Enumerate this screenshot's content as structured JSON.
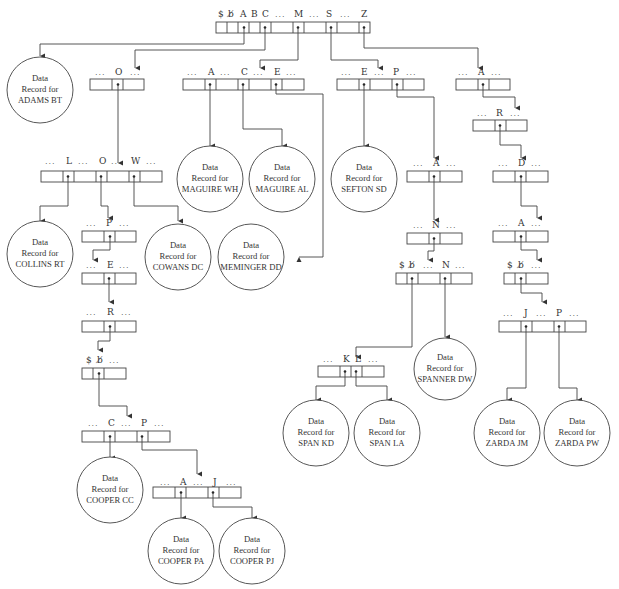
{
  "diagram": {
    "type": "trie-index-tree",
    "record_prefix_line1": "Data",
    "record_prefix_line2": "Record for",
    "ellipsis": "...",
    "blank_symbol": "b̸",
    "dollar_symbol": "$"
  },
  "nodes": {
    "root": {
      "labels": [
        "$",
        "b̸",
        "A",
        "B",
        "C",
        "...",
        "M",
        "...",
        "S",
        "...",
        "Z"
      ]
    },
    "n_A": {
      "labels": [
        "...",
        "O",
        "..."
      ]
    },
    "n_M": {
      "labels": [
        "...",
        "A",
        "...",
        "C",
        "...",
        "E",
        "..."
      ]
    },
    "n_S": {
      "labels": [
        "...",
        "E",
        "...",
        "P",
        "..."
      ]
    },
    "n_Z": {
      "labels": [
        "...",
        "A",
        "..."
      ]
    },
    "n_ZA": {
      "labels": [
        "...",
        "R",
        "..."
      ]
    },
    "n_ZAR": {
      "labels": [
        "...",
        "D",
        "..."
      ]
    },
    "n_ZARD": {
      "labels": [
        "...",
        "A",
        "..."
      ]
    },
    "n_ZARDA": {
      "labels": [
        "$",
        "b̸",
        "..."
      ]
    },
    "n_ZARDAb": {
      "labels": [
        "...",
        "J",
        "...",
        "P",
        "..."
      ]
    },
    "n_CO": {
      "labels": [
        "...",
        "L",
        "...",
        "O",
        "...",
        "W",
        "..."
      ]
    },
    "n_COO": {
      "labels": [
        "...",
        "P",
        "..."
      ]
    },
    "n_COOP": {
      "labels": [
        "...",
        "E",
        "..."
      ]
    },
    "n_COOPE": {
      "labels": [
        "...",
        "R",
        "..."
      ]
    },
    "n_COOPER": {
      "labels": [
        "$",
        "b̸",
        "..."
      ]
    },
    "n_COOPERb": {
      "labels": [
        "...",
        "C",
        "...",
        "P",
        "..."
      ]
    },
    "n_COOPERbP": {
      "labels": [
        "...",
        "A",
        "...",
        "J",
        "..."
      ]
    },
    "n_SP": {
      "labels": [
        "...",
        "A",
        "..."
      ]
    },
    "n_SPA": {
      "labels": [
        "...",
        "N",
        "..."
      ]
    },
    "n_SPAN": {
      "labels": [
        "$",
        "b̸",
        "...",
        "N",
        "..."
      ]
    },
    "n_SPANb": {
      "labels": [
        "...",
        "K",
        "L",
        "..."
      ]
    }
  },
  "records": [
    {
      "id": "adams",
      "name": "ADAMS BT"
    },
    {
      "id": "maguire_wh",
      "name": "MAGUIRE WH"
    },
    {
      "id": "maguire_al",
      "name": "MAGUIRE AL"
    },
    {
      "id": "sefton",
      "name": "SEFTON SD"
    },
    {
      "id": "collins",
      "name": "COLLINS RT"
    },
    {
      "id": "cowans",
      "name": "COWANS DC"
    },
    {
      "id": "meminger",
      "name": "MEMINGER DD"
    },
    {
      "id": "spanner",
      "name": "SPANNER DW"
    },
    {
      "id": "cooper_cc",
      "name": "COOPER CC"
    },
    {
      "id": "cooper_pa",
      "name": "COOPER PA"
    },
    {
      "id": "cooper_pj",
      "name": "COOPER PJ"
    },
    {
      "id": "span_kd",
      "name": "SPAN KD"
    },
    {
      "id": "span_la",
      "name": "SPAN LA"
    },
    {
      "id": "zarda_jm",
      "name": "ZARDA JM"
    },
    {
      "id": "zarda_pw",
      "name": "ZARDA PW"
    }
  ]
}
